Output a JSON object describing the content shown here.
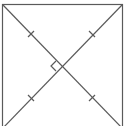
{
  "diagram": {
    "square": {
      "x1": 2.5,
      "y1": 4.5,
      "x2": 122.5,
      "y2": 128
    },
    "intersection": {
      "x": 61,
      "y": 66
    },
    "stroke_color": "#5a5a5a",
    "tick_marks": [
      {
        "x": 31,
        "y": 34,
        "orientation": "perp-to-main-diagonal"
      },
      {
        "x": 92,
        "y": 34,
        "orientation": "perp-to-anti-diagonal"
      },
      {
        "x": 31,
        "y": 98,
        "orientation": "perp-to-anti-diagonal"
      },
      {
        "x": 92,
        "y": 98,
        "orientation": "perp-to-main-diagonal"
      }
    ],
    "right_angle_marker": {
      "position": "left-of-intersection"
    }
  }
}
